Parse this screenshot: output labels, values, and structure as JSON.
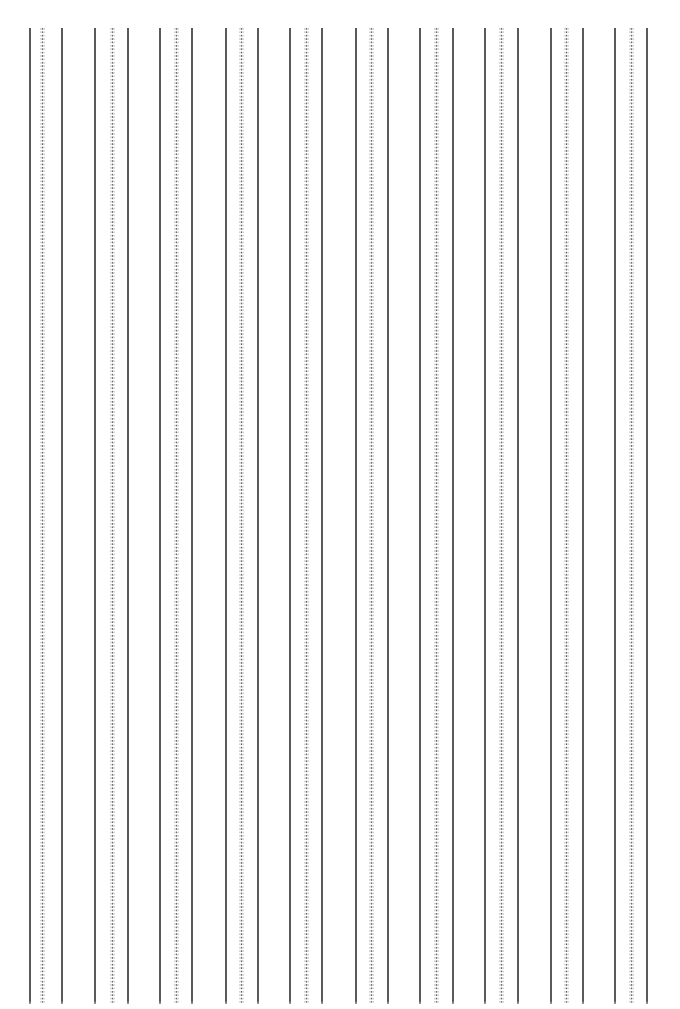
{
  "page": {
    "width": 680,
    "height": 1009,
    "background_color": "#ffffff"
  },
  "pattern": {
    "description": "Repeating vertical rule groups, each group of three lines: solid, dotted, solid",
    "line_top_y": 28,
    "line_bottom_y": 1004,
    "group_spacing_px": 65,
    "group_count": 10,
    "solid_color": "#5a5a5a",
    "dotted_color": "#6e6e6e",
    "dotted_halo_color": "#969696",
    "solid_width_px": 2,
    "dotted_width_px": 1,
    "dot_period_px": 3.4
  },
  "chart_data": {
    "type": "line",
    "title": "",
    "subtitle": "",
    "xlabel": "",
    "ylabel": "",
    "grid": false,
    "legend_position": "none",
    "orientation": "vertical",
    "xlim": [
      0,
      680
    ],
    "ylim": [
      0,
      1009
    ],
    "series": [
      {
        "name": "solid-rules",
        "style": "solid",
        "color": "#5a5a5a",
        "x": [
          30,
          62,
          95,
          128,
          160,
          192,
          226,
          258,
          290,
          322,
          356,
          388,
          420,
          453,
          485,
          518,
          551,
          583,
          615,
          647
        ],
        "y_start": 28,
        "y_end": 1004
      },
      {
        "name": "dotted-rules",
        "style": "dotted",
        "color": "#6e6e6e",
        "x": [
          42,
          112,
          176,
          241,
          306,
          371,
          436,
          501,
          566,
          631
        ],
        "y_start": 28,
        "y_end": 1004
      }
    ],
    "groups": [
      {
        "index": 1,
        "solid_left": 30,
        "dotted": 42,
        "solid_right": 62
      },
      {
        "index": 2,
        "solid_left": 95,
        "dotted": 112,
        "solid_right": 128
      },
      {
        "index": 3,
        "solid_left": 160,
        "dotted": 176,
        "solid_right": 192
      },
      {
        "index": 4,
        "solid_left": 226,
        "dotted": 241,
        "solid_right": 258
      },
      {
        "index": 5,
        "solid_left": 290,
        "dotted": 306,
        "solid_right": 322
      },
      {
        "index": 6,
        "solid_left": 356,
        "dotted": 371,
        "solid_right": 388
      },
      {
        "index": 7,
        "solid_left": 420,
        "dotted": 436,
        "solid_right": 453
      },
      {
        "index": 8,
        "solid_left": 485,
        "dotted": 501,
        "solid_right": 518
      },
      {
        "index": 9,
        "solid_left": 551,
        "dotted": 566,
        "solid_right": 583
      },
      {
        "index": 10,
        "solid_left": 615,
        "dotted": 631,
        "solid_right": 647
      }
    ]
  }
}
